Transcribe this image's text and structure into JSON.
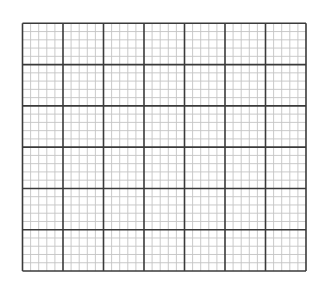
{
  "grid": {
    "left": 22.5,
    "top": 23.3,
    "width": 283.5,
    "height": 247.7,
    "columns": 7,
    "rows": 6,
    "subdivisions": 5,
    "colors": {
      "background": "#ffffff",
      "major": "#3a3a3a",
      "minor": "#c4c4c4"
    },
    "major_width": 1.6,
    "minor_width": 0.9
  }
}
